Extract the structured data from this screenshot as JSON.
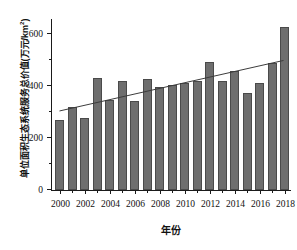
{
  "chart_data": {
    "type": "bar",
    "title": "",
    "xlabel": "年份",
    "ylabel": "单位面积生态系统服务总价值(万元/km²)",
    "categories": [
      2000,
      2001,
      2002,
      2003,
      2004,
      2005,
      2006,
      2007,
      2008,
      2009,
      2010,
      2011,
      2012,
      2013,
      2014,
      2015,
      2016,
      2017,
      2018
    ],
    "values": [
      268,
      320,
      277,
      430,
      347,
      417,
      340,
      425,
      396,
      402,
      412,
      419,
      490,
      418,
      455,
      374,
      410,
      487,
      625
    ],
    "series": [
      {
        "name": "单位面积生态系统服务总价值",
        "type": "bar",
        "values": [
          268,
          320,
          277,
          430,
          347,
          417,
          340,
          425,
          396,
          402,
          412,
          419,
          490,
          418,
          455,
          374,
          410,
          487,
          625
        ],
        "color": "#6e6e6e"
      },
      {
        "name": "趋势线",
        "type": "line",
        "x": [
          2000,
          2018
        ],
        "values": [
          305,
          500
        ],
        "color": "#3a3a3a"
      }
    ],
    "ylim": [
      0,
      660
    ],
    "xlim": [
      1999.4,
      2018.6
    ],
    "ytick_values": [
      0,
      200,
      400,
      600
    ],
    "ytick_labels": [
      "0",
      "200",
      "400",
      "600"
    ],
    "yminor_values": [
      100,
      300,
      500
    ],
    "xtick_labels": [
      "2000",
      "2002",
      "2004",
      "2006",
      "2008",
      "2010",
      "2012",
      "2014",
      "2016",
      "2018"
    ],
    "xtick_values": [
      2000,
      2002,
      2004,
      2006,
      2008,
      2010,
      2012,
      2014,
      2016,
      2018
    ],
    "xminor_values": [
      2001,
      2003,
      2005,
      2007,
      2009,
      2011,
      2013,
      2015,
      2017
    ],
    "grid": false,
    "legend": "none",
    "bar_color": "#6e6e6e",
    "bar_edge_color": "#4a4a4a",
    "axis_color": "#1a1a1a",
    "background": "#ffffff"
  },
  "axis": {
    "ylabel_main": "单位面积生态系统服务总价值(万元/km",
    "ylabel_sup": "2",
    "ylabel_tail": ")",
    "xlabel": "年份"
  }
}
